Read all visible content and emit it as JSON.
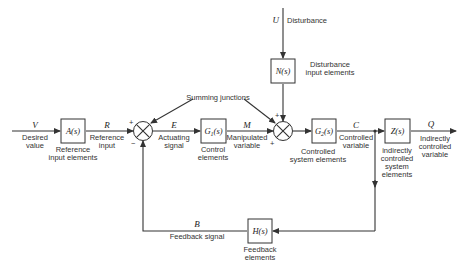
{
  "diagram": {
    "type": "control-system-block-diagram",
    "signals": {
      "V": {
        "symbol": "V",
        "label_1": "Desired",
        "label_2": "value"
      },
      "R": {
        "symbol": "R",
        "label_1": "Reference",
        "label_2": "input"
      },
      "E": {
        "symbol": "E",
        "label_1": "Actuating",
        "label_2": "signal"
      },
      "M": {
        "symbol": "M",
        "label_1": "Manipulated",
        "label_2": "variable"
      },
      "C": {
        "symbol": "C",
        "label_1": "Controlled",
        "label_2": "variable"
      },
      "Q": {
        "symbol": "Q",
        "label_1": "Indirectly",
        "label_2": "controlled",
        "label_3": "variable"
      },
      "B": {
        "symbol": "B",
        "label_1": "Feedback signal"
      },
      "U": {
        "symbol": "U",
        "label_1": "Disturbance"
      }
    },
    "blocks": {
      "A": {
        "tf": "A(s)",
        "label_1": "Reference",
        "label_2": "input elements"
      },
      "G1": {
        "tf_main": "G",
        "tf_sub": "1",
        "tf_arg": "(s)",
        "label_1": "Control",
        "label_2": "elements"
      },
      "G2": {
        "tf_main": "G",
        "tf_sub": "2",
        "tf_arg": "(s)",
        "label_1": "Controlled",
        "label_2": "system elements"
      },
      "Z": {
        "tf": "Z(s)",
        "label_1": "indirectly",
        "label_2": "controlled",
        "label_3": "system",
        "label_4": "elements"
      },
      "N": {
        "tf": "N(s)",
        "label_1": "Disturbance",
        "label_2": "input elements"
      },
      "H": {
        "tf": "H(s)",
        "label_1": "Feedback",
        "label_2": "elements"
      }
    },
    "junctions": {
      "label": "Summing junctions",
      "sj1": {
        "sign_top": "+",
        "sign_bottom": "−"
      },
      "sj2": {
        "sign_top": "+",
        "sign_bottom": "+"
      }
    }
  }
}
